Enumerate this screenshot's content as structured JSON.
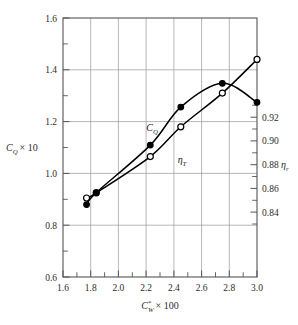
{
  "chart_data": {
    "type": "line",
    "title": "",
    "subtitle": "",
    "xlabel": "C*W × 100",
    "ylabel": "CQ × 10",
    "ylabel_right": "ηT",
    "xlim": [
      1.6,
      3.0
    ],
    "ylim": [
      0.6,
      1.6
    ],
    "ylim_right": [
      0.8265,
      0.9355
    ],
    "grid": true,
    "legend": "inline-annotations",
    "x_ticks": [
      "1.6",
      "1.8",
      "2.0",
      "2.2",
      "2.4",
      "2.6",
      "2.8",
      "3.0"
    ],
    "x_tick_values": [
      1.6,
      1.8,
      2.0,
      2.2,
      2.4,
      2.6,
      2.8,
      3.0
    ],
    "y_ticks_left": [
      "0.6",
      "0.8",
      "1.0",
      "1.2",
      "1.4",
      "1.6"
    ],
    "y_tick_values_left": [
      0.6,
      0.8,
      1.0,
      1.2,
      1.4,
      1.6
    ],
    "y_minor_left": [
      0.7,
      0.9,
      1.1,
      1.3,
      1.5
    ],
    "y_ticks_right": [
      "0.84",
      "0.86",
      "0.88",
      "0.90",
      "0.92"
    ],
    "y_tick_values_right": [
      0.84,
      0.86,
      0.88,
      0.9,
      0.92
    ],
    "series": [
      {
        "name": "CQ",
        "label": "CQ",
        "axis": "left",
        "marker": "open-circle",
        "color": "#000000",
        "x": [
          1.77,
          1.84,
          2.23,
          2.45,
          2.75,
          3.0
        ],
        "values": [
          0.905,
          0.925,
          1.065,
          1.18,
          1.31,
          1.44
        ]
      },
      {
        "name": "etaT",
        "label": "ηT",
        "axis": "right",
        "marker": "filled-circle",
        "color": "#000000",
        "x": [
          1.77,
          1.84,
          2.23,
          2.45,
          2.75,
          3.0
        ],
        "values": [
          0.857,
          0.862,
          0.882,
          0.898,
          0.908,
          0.9
        ]
      }
    ]
  },
  "axes": {
    "x_title_main": "C",
    "x_title_sub": "W",
    "x_title_sup": "*",
    "x_title_rest": "× 100",
    "y_left_main": "C",
    "y_left_sub": "Q",
    "y_left_rest": "× 10",
    "y_right_main": "η",
    "y_right_sub": "r"
  },
  "annotations": [
    {
      "name": "cq-curve-label",
      "main": "C",
      "sub": "Q"
    },
    {
      "name": "eta-curve-label",
      "main": "η",
      "sub": "T"
    }
  ],
  "colors": {
    "frame": "#555555",
    "grid": "#9a9a9a",
    "curve": "#000000",
    "marker_fill_open": "#ffffff",
    "marker_fill_closed": "#000000",
    "text": "#2b2b2b",
    "background": "#ffffff"
  }
}
